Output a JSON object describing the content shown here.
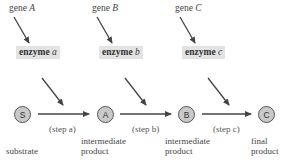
{
  "genes": [
    {
      "prefix": "gene ",
      "letter": "A"
    },
    {
      "prefix": "gene ",
      "letter": "B"
    },
    {
      "prefix": "gene ",
      "letter": "C"
    }
  ],
  "enzymes": [
    {
      "prefix": "enzyme ",
      "letter": "a"
    },
    {
      "prefix": "enzyme ",
      "letter": "b"
    },
    {
      "prefix": "enzyme ",
      "letter": "c"
    }
  ],
  "nodes": [
    {
      "symbol": "S",
      "label_line1": "substrate",
      "label_line2": ""
    },
    {
      "symbol": "A",
      "label_line1": "intermediate",
      "label_line2": "product"
    },
    {
      "symbol": "B",
      "label_line1": "intermediate",
      "label_line2": "product"
    },
    {
      "symbol": "C",
      "label_line1": "final",
      "label_line2": "product"
    }
  ],
  "steps": [
    "(step a)",
    "(step b)",
    "(step c)"
  ],
  "colors": {
    "arrow": "#444444",
    "node_fill": "#c9c9c9",
    "enzyme_bg": "#e3e3e3"
  }
}
